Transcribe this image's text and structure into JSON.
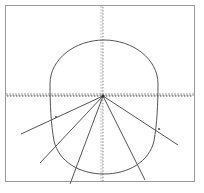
{
  "figure": {
    "background_color": "#ffffff",
    "frame": {
      "name": "plot-frame",
      "x": 5.5,
      "y": 5.5,
      "width": 189,
      "height": 176,
      "stroke": "#9a9a9a",
      "stroke_width": 1
    },
    "axes": {
      "origin": {
        "x": 103,
        "y": 96
      },
      "horizontal": {
        "name": "x-axis",
        "y": 96,
        "x_start": 7,
        "x_end": 193,
        "style": "dotted-with-ticks",
        "stroke": "#4a4a4a",
        "stroke_width": 1,
        "tick_count": 62,
        "tick_height": 3,
        "tick_color": "#6b6b6b"
      },
      "vertical": {
        "name": "y-axis",
        "x": 103,
        "y_start": 7,
        "y_end": 181,
        "style": "dotted-with-ticks",
        "stroke": "#8a8a8a",
        "stroke_width": 1,
        "tick_count": 58,
        "tick_width": 3,
        "tick_color": "#9a9a9a"
      }
    },
    "oval": {
      "name": "egg-curve",
      "stroke": "#555555",
      "stroke_width": 1,
      "fill": "none",
      "top_y": 40,
      "bottom_y": 174,
      "left_x": 52,
      "right_x": 158,
      "center_x": 104,
      "path": "M 104 40 C 133 40 158 59 158 84 C 158 104 157 124 154 141 C 149 162 128 174 104 174 C 80 174 59 162 54 141 C 51 124 50 104 50 84 C 50 59 75 40 104 40 Z"
    },
    "rays": [
      {
        "name": "ray-1-upper-left",
        "x1": 103,
        "y1": 96,
        "x2": 21,
        "y2": 134,
        "stroke": "#555555",
        "stroke_width": 1
      },
      {
        "name": "ray-2-left",
        "x1": 103,
        "y1": 96,
        "x2": 40,
        "y2": 163,
        "stroke": "#555555",
        "stroke_width": 1
      },
      {
        "name": "ray-3-lower-left",
        "x1": 103,
        "y1": 96,
        "x2": 70,
        "y2": 184,
        "stroke": "#555555",
        "stroke_width": 1
      },
      {
        "name": "ray-4-lower-right",
        "x1": 103,
        "y1": 96,
        "x2": 145,
        "y2": 180,
        "stroke": "#555555",
        "stroke_width": 1
      },
      {
        "name": "ray-5-right",
        "x1": 103,
        "y1": 96,
        "x2": 178,
        "y2": 145,
        "stroke": "#555555",
        "stroke_width": 1
      }
    ],
    "intersection_markers": [
      {
        "name": "marker-left-chord",
        "x": 56,
        "y": 117
      },
      {
        "name": "marker-right-chord",
        "x": 159,
        "y": 129
      }
    ]
  },
  "chart_data": {
    "type": "scatter",
    "xlabel": "",
    "ylabel": "",
    "grid": false,
    "legend": null,
    "origin_point": {
      "x": 103,
      "y": 96
    },
    "curve_extents": {
      "top": 40,
      "bottom": 174,
      "left": 52,
      "right": 158
    },
    "ray_angles_deg": [
      155.1,
      133.2,
      110.6,
      63.4,
      33.2
    ],
    "series": [
      {
        "name": "oval-outline",
        "values": [
          52,
          40,
          158,
          174
        ]
      },
      {
        "name": "rays-from-origin",
        "values": [
          5
        ]
      }
    ]
  }
}
